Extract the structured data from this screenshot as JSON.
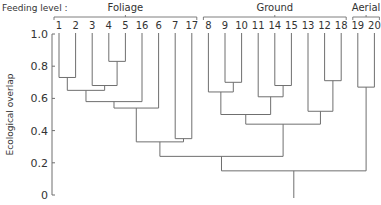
{
  "chart_data": {
    "type": "dendrogram",
    "title": "",
    "ylabel": "Ecological overlap",
    "xlabel": "",
    "ylim": [
      0,
      1.0
    ],
    "yticks": [
      "0",
      "0.2",
      "0.4",
      "0.6",
      "0.8",
      "1.0"
    ],
    "grid": false,
    "header_label": "Feeding level :",
    "groups": [
      {
        "name": "Foliage",
        "leaves": [
          "1",
          "2",
          "3",
          "4",
          "5",
          "16",
          "6",
          "7",
          "17"
        ]
      },
      {
        "name": "Ground",
        "leaves": [
          "8",
          "9",
          "10",
          "11",
          "14",
          "15",
          "13",
          "12",
          "18"
        ]
      },
      {
        "name": "Aerial",
        "leaves": [
          "19",
          "20"
        ]
      }
    ],
    "leaves": [
      "1",
      "2",
      "3",
      "4",
      "5",
      "16",
      "6",
      "7",
      "17",
      "8",
      "9",
      "10",
      "11",
      "14",
      "15",
      "13",
      "12",
      "18",
      "19",
      "20"
    ],
    "merges": [
      {
        "id": "A",
        "children": [
          "4",
          "5"
        ],
        "height": 0.83
      },
      {
        "id": "B",
        "children": [
          "1",
          "2"
        ],
        "height": 0.73
      },
      {
        "id": "C",
        "children": [
          "3",
          "A"
        ],
        "height": 0.68
      },
      {
        "id": "D",
        "children": [
          "B",
          "C"
        ],
        "height": 0.65
      },
      {
        "id": "E",
        "children": [
          "D",
          "16"
        ],
        "height": 0.58
      },
      {
        "id": "F",
        "children": [
          "E",
          "6"
        ],
        "height": 0.54
      },
      {
        "id": "G",
        "children": [
          "7",
          "17"
        ],
        "height": 0.35
      },
      {
        "id": "H",
        "children": [
          "F",
          "G"
        ],
        "height": 0.33
      },
      {
        "id": "I",
        "children": [
          "9",
          "10"
        ],
        "height": 0.7
      },
      {
        "id": "J",
        "children": [
          "8",
          "I"
        ],
        "height": 0.64
      },
      {
        "id": "K",
        "children": [
          "14",
          "15"
        ],
        "height": 0.68
      },
      {
        "id": "L",
        "children": [
          "11",
          "K"
        ],
        "height": 0.61
      },
      {
        "id": "M",
        "children": [
          "J",
          "L"
        ],
        "height": 0.5
      },
      {
        "id": "N",
        "children": [
          "12",
          "18"
        ],
        "height": 0.71
      },
      {
        "id": "O",
        "children": [
          "13",
          "N"
        ],
        "height": 0.52
      },
      {
        "id": "P",
        "children": [
          "M",
          "O"
        ],
        "height": 0.44
      },
      {
        "id": "Q",
        "children": [
          "H",
          "P"
        ],
        "height": 0.24
      },
      {
        "id": "R",
        "children": [
          "19",
          "20"
        ],
        "height": 0.67
      },
      {
        "id": "S",
        "children": [
          "Q",
          "R"
        ],
        "height": 0.15
      }
    ]
  }
}
